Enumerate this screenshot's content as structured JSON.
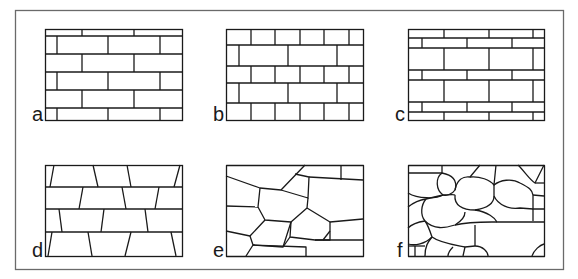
{
  "figure": {
    "frame": {
      "x": 15,
      "y": 10,
      "w": 548,
      "h": 259,
      "stroke": "#555555"
    },
    "line_color": "#1a1a1a",
    "panels": [
      {
        "id": "a",
        "label": "a",
        "pattern": "running bond, courses with half-offset bricks",
        "x": 45,
        "y": 29,
        "w": 137,
        "h": 91
      },
      {
        "id": "b",
        "label": "b",
        "pattern": "alternating short and long bricks courses",
        "x": 226,
        "y": 29,
        "w": 137,
        "h": 91
      },
      {
        "id": "c",
        "label": "c",
        "pattern": "alternating thin and tall courses",
        "x": 408,
        "y": 29,
        "w": 136,
        "h": 91
      },
      {
        "id": "d",
        "label": "d",
        "pattern": "trapezoidal bricks in regular courses",
        "x": 45,
        "y": 165,
        "w": 137,
        "h": 91
      },
      {
        "id": "e",
        "label": "e",
        "pattern": "irregular polygonal stones",
        "x": 226,
        "y": 165,
        "w": 137,
        "h": 91
      },
      {
        "id": "f",
        "label": "f",
        "pattern": "rounded rubble stones",
        "x": 408,
        "y": 165,
        "w": 136,
        "h": 91
      }
    ]
  }
}
